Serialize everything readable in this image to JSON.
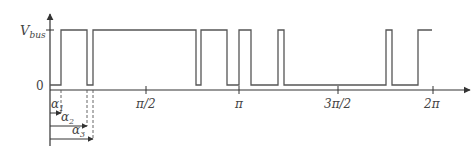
{
  "diagram": {
    "title": "",
    "y_labels": {
      "high": "V",
      "high_sub": "bus",
      "low": "0"
    },
    "x_ticks": [
      {
        "label": "π/2",
        "x": 146
      },
      {
        "label": "π",
        "x": 239
      },
      {
        "label": "3π/2",
        "x": 338
      },
      {
        "label": "2π",
        "x": 433
      }
    ],
    "angles": [
      {
        "label": "α",
        "sub": "1"
      },
      {
        "label": "α",
        "sub": "2"
      },
      {
        "label": "α",
        "sub": "3"
      }
    ],
    "waveform_edges_px": [
      61,
      87,
      93,
      196,
      201,
      227,
      239,
      251,
      278,
      284,
      386,
      392,
      418
    ],
    "colors": {
      "line": "#555555",
      "axis": "#333333"
    }
  }
}
